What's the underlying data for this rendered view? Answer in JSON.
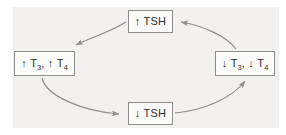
{
  "diagram": {
    "type": "cycle-diagram",
    "panel_color": "#f2f1f0",
    "box_border_color": "#8d8d8d",
    "box_fill_color": "#fbfbfa",
    "arrow_color": "#8f8f8f",
    "text_color": "#2e2e2e",
    "nodes": [
      {
        "id": "top",
        "position": "top",
        "full_text": "↑ TSH",
        "arrow": "↑",
        "analyte": "TSH",
        "direction": "increase"
      },
      {
        "id": "left",
        "position": "left",
        "full_text": "↑ T3, ↑ T4",
        "arrow_first": "↑",
        "analyte_first": "T",
        "sub_first": "3",
        "separator": ",",
        "arrow_second": "↑",
        "analyte_second": "T",
        "sub_second": "4",
        "direction": "increase"
      },
      {
        "id": "bottom",
        "position": "bottom",
        "full_text": "↓ TSH",
        "arrow": "↓",
        "analyte": "TSH",
        "direction": "decrease"
      },
      {
        "id": "right",
        "position": "right",
        "full_text": "↓ T3, ↓ T4",
        "arrow_first": "↓",
        "analyte_first": "T",
        "sub_first": "3",
        "separator": ",",
        "arrow_second": "↓",
        "analyte_second": "T",
        "sub_second": "4",
        "direction": "decrease"
      }
    ],
    "edges": [
      {
        "id": "top-to-left",
        "from": "top",
        "to": "left",
        "style": "curved-arrow"
      },
      {
        "id": "left-to-bottom",
        "from": "left",
        "to": "bottom",
        "style": "curved-arrow"
      },
      {
        "id": "bottom-to-right",
        "from": "bottom",
        "to": "right",
        "style": "curved-arrow"
      },
      {
        "id": "right-to-top",
        "from": "right",
        "to": "top",
        "style": "curved-arrow"
      }
    ]
  }
}
